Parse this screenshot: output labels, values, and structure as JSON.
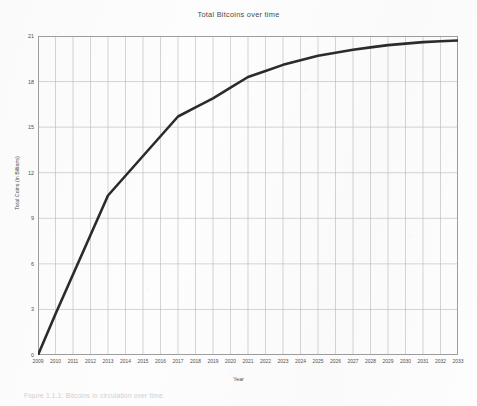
{
  "document": {
    "caption": "Figure 1.1.1:  Bitcoins in circulation over time."
  },
  "chart_data": {
    "type": "line",
    "title": "Total Bitcoins over time",
    "xlabel": "Year",
    "ylabel": "Total Coins (in Billions)",
    "xlim": [
      2009,
      2033
    ],
    "ylim": [
      0,
      21
    ],
    "yticks": [
      21,
      18,
      15,
      12,
      9,
      6,
      3,
      0
    ],
    "grid": true,
    "legend": "none",
    "line_color": "#2b2b2b",
    "grid_color": "#b9b9b9",
    "categories": [
      "2009",
      "2010",
      "2011",
      "2012",
      "2013",
      "2014",
      "2015",
      "2016",
      "2017",
      "2018",
      "2019",
      "2020",
      "2021",
      "2022",
      "2023",
      "2024",
      "2025",
      "2026",
      "2027",
      "2028",
      "2029",
      "2030",
      "2031",
      "2032",
      "2033"
    ],
    "x": [
      2009,
      2010,
      2011,
      2012,
      2013,
      2014,
      2015,
      2016,
      2017,
      2018,
      2019,
      2020,
      2021,
      2022,
      2023,
      2024,
      2025,
      2026,
      2027,
      2028,
      2029,
      2030,
      2031,
      2032,
      2033
    ],
    "values": [
      0.0,
      2.7,
      5.3,
      7.9,
      10.5,
      11.8,
      13.1,
      14.4,
      15.7,
      16.3,
      16.9,
      17.6,
      18.3,
      18.7,
      19.1,
      19.4,
      19.7,
      19.9,
      20.1,
      20.25,
      20.4,
      20.5,
      20.6,
      20.65,
      20.7
    ],
    "series": [
      {
        "name": "Total Bitcoins",
        "values": [
          0.0,
          2.7,
          5.3,
          7.9,
          10.5,
          11.8,
          13.1,
          14.4,
          15.7,
          16.3,
          16.9,
          17.6,
          18.3,
          18.7,
          19.1,
          19.4,
          19.7,
          19.9,
          20.1,
          20.25,
          20.4,
          20.5,
          20.6,
          20.65,
          20.7
        ]
      }
    ]
  }
}
